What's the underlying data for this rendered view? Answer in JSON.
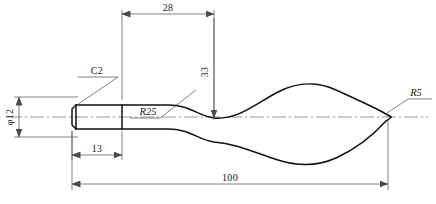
{
  "drawing": {
    "title": "Tool Handle Profile Drawing",
    "type": "mechanical-engineering-part-drawing",
    "projection": "front-view-half-section",
    "units": "mm",
    "background_color": "#ffffff",
    "outline_color": "#111111",
    "dimension_color": "#4a4a4a",
    "centerline_color": "#6a6a6a"
  },
  "dimensions": [
    {
      "id": "length-28",
      "label": "28",
      "kind": "linear-horizontal",
      "value": 28,
      "position": "top",
      "orientation": "horizontal",
      "from_x": 122,
      "to_x": 214,
      "line_y": 14
    },
    {
      "id": "height-33",
      "label": "33",
      "kind": "linear-vertical",
      "value": 33,
      "position": "upper-right-of-neck",
      "orientation": "vertical-rotated",
      "line_x": 214,
      "from_y": 14,
      "to_y": 118
    },
    {
      "id": "diameter-12",
      "label": "φ12",
      "kind": "diameter",
      "value": 12,
      "position": "left",
      "orientation": "vertical-rotated",
      "line_x": 19,
      "from_y": 97,
      "to_y": 137
    },
    {
      "id": "length-13",
      "label": "13",
      "kind": "linear-horizontal",
      "value": 13,
      "position": "below-cylinder",
      "orientation": "horizontal",
      "from_x": 72,
      "to_x": 122,
      "line_y": 155
    },
    {
      "id": "length-100",
      "label": "100",
      "kind": "linear-horizontal",
      "value": 100,
      "position": "bottom-overall",
      "orientation": "horizontal",
      "from_x": 72,
      "to_x": 388,
      "line_y": 184
    }
  ],
  "annotations": [
    {
      "id": "chamfer-c2",
      "label": "C2",
      "kind": "chamfer-leader",
      "value": "C2",
      "target": "left-end-chamfer",
      "text_x": 88,
      "text_y": 72
    },
    {
      "id": "radius-r25",
      "label": "R25",
      "kind": "radius-leader",
      "value": 25,
      "target": "neck-concave-arc",
      "italic": true,
      "text_x": 134,
      "text_y": 114
    },
    {
      "id": "radius-r5",
      "label": "R5",
      "kind": "radius-leader",
      "value": 5,
      "target": "right-tip-round",
      "italic": true,
      "text_x": 408,
      "text_y": 96
    }
  ],
  "geometry": {
    "axis_y": 117,
    "cylinder": {
      "left_x": 72,
      "right_x": 122,
      "top_y": 105,
      "bottom_y": 129,
      "chamfer": 4
    },
    "body": {
      "start_x": 122,
      "tip_x": 388,
      "neck_min_half_height": 17,
      "max_half_height": 36
    }
  }
}
